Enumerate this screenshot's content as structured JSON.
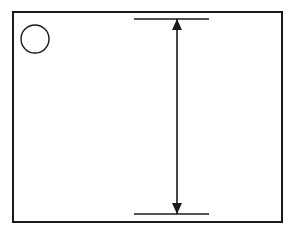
{
  "figure": {
    "kind": "technical-illustration",
    "background_color": "#ffffff",
    "line_color": "#1a1a1a",
    "fill_color": "#ffffff",
    "frame": {
      "name": "illustration-border",
      "x": 13,
      "y": 12,
      "width": 269,
      "height": 210,
      "stroke_width": 2
    },
    "callout": {
      "label": "40",
      "shape": "circle",
      "center_x": 35,
      "center_y": 39,
      "radius": 14,
      "stroke_width": 1.4
    },
    "spring": {
      "name": "compression-spring",
      "left_x": 89,
      "right_x": 140,
      "top_y": 17,
      "bottom_y": 216,
      "coil_count": 18,
      "pitch": 11,
      "wire_width": 2.6,
      "end_type": "closed-and-ground",
      "stroke_width": 1.1
    },
    "dimension": {
      "name": "free-length-dimension",
      "label": "",
      "line_x": 177,
      "top_y": 19,
      "bottom_y": 214,
      "arrow_half_width": 5,
      "arrow_length": 11,
      "stroke_width": 1.6,
      "extension_top": {
        "x1": 134,
        "x2": 209,
        "y": 19
      },
      "extension_bottom": {
        "x1": 134,
        "x2": 209,
        "y": 214
      }
    }
  }
}
